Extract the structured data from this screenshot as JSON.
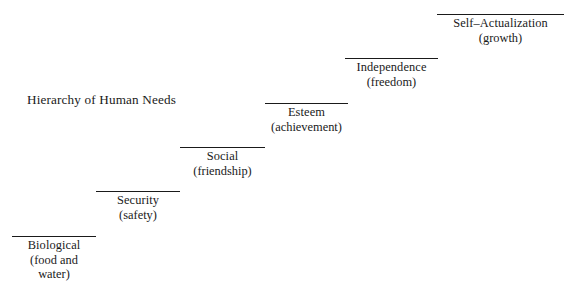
{
  "diagram": {
    "title": "Hierarchy of Human Needs",
    "type": "staircase",
    "background_color": "#ffffff",
    "text_color": "#1a1a1a",
    "rule_color": "#1a1a1a",
    "steps": [
      {
        "name": "Biological",
        "qualifier": "(food and",
        "qualifier_line2": "water)",
        "level": 1
      },
      {
        "name": "Security",
        "qualifier": "(safety)",
        "level": 2
      },
      {
        "name": "Social",
        "qualifier": "(friendship)",
        "level": 3
      },
      {
        "name": "Esteem",
        "qualifier": "(achievement)",
        "level": 4
      },
      {
        "name": "Independence",
        "qualifier": "(freedom)",
        "level": 5
      },
      {
        "name": "Self–Actualization",
        "qualifier": "(growth)",
        "level": 6
      }
    ]
  }
}
